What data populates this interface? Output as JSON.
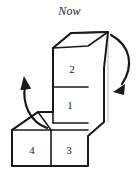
{
  "figure": {
    "title": "Now",
    "background_color": "#ffffff",
    "ink_color": "#1a1a1a",
    "hidden_edge_color": "#9a9a9a"
  },
  "blocks": [
    {
      "id": "block-2",
      "label": "2",
      "x": 72,
      "y": 69,
      "position": "upper-front"
    },
    {
      "id": "block-1",
      "label": "1",
      "x": 70,
      "y": 105,
      "position": "middle-front"
    },
    {
      "id": "block-4",
      "label": "4",
      "x": 32,
      "y": 150,
      "position": "lower-left-front"
    },
    {
      "id": "block-3",
      "label": "3",
      "x": 69,
      "y": 150,
      "position": "lower-right-front"
    }
  ],
  "arrows": [
    {
      "id": "arrow-left",
      "direction": "counterclockwise-up",
      "head": "top"
    },
    {
      "id": "arrow-right",
      "direction": "clockwise-down",
      "head": "bottom"
    }
  ]
}
